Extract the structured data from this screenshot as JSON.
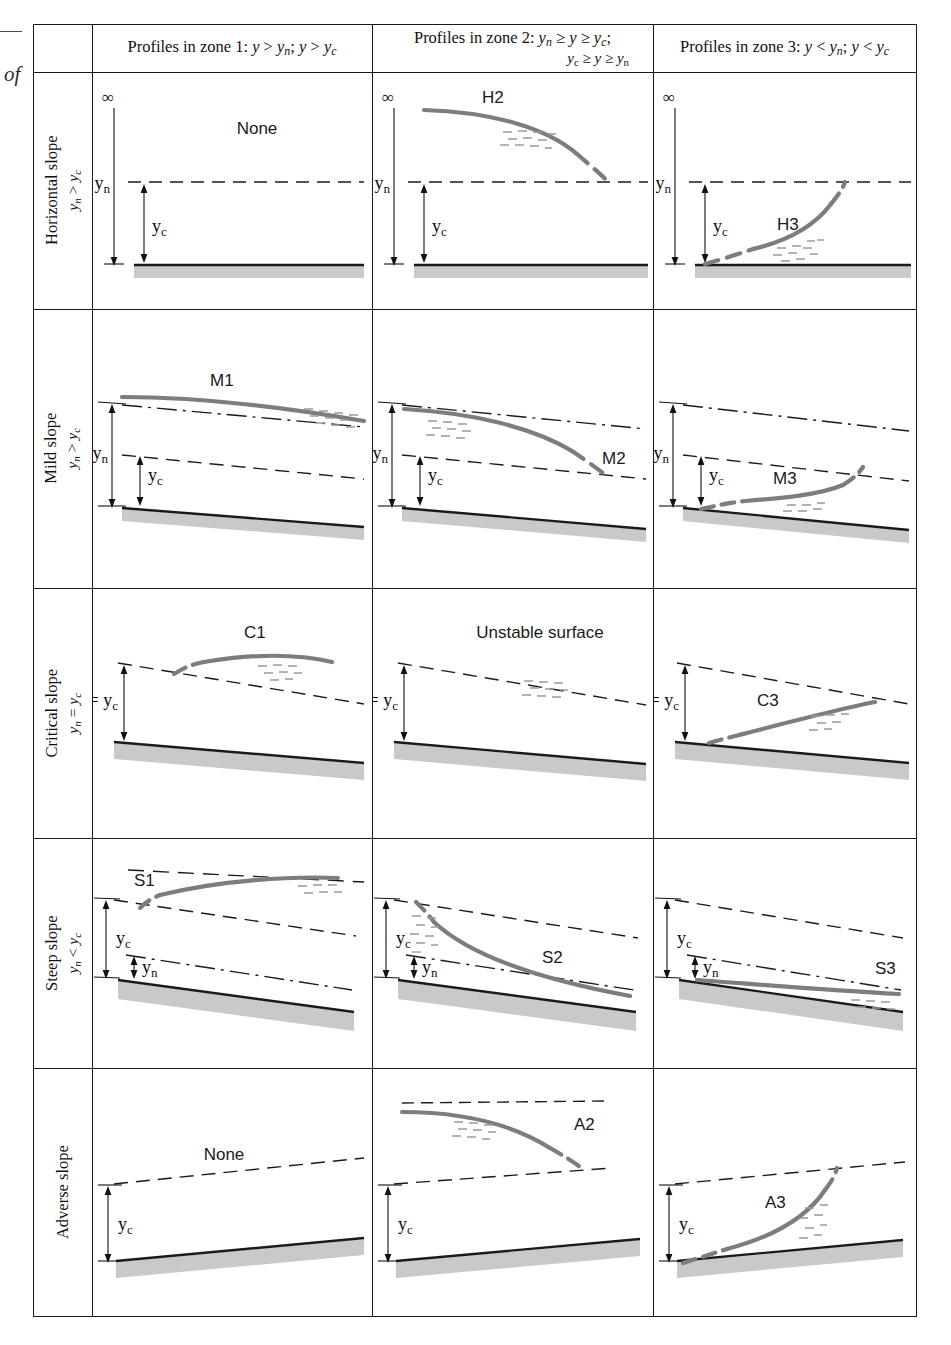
{
  "margin": {
    "partial_caption": "of"
  },
  "header": {
    "corner": "",
    "zone1": "Profiles in zone 1: y > yₙ; y > yᴄ",
    "zone1_parts": {
      "prefix": "Profiles in zone 1:",
      "c1": "y",
      "c1s": "n",
      "c2": "y",
      "c2s": "c"
    },
    "zone2_line1": "Profiles in zone 2: yₙ ≥ y ≥ yᴄ;",
    "zone2_line2": "yᴄ ≥ y ≥ yₙ",
    "zone3": "Profiles in zone 3: y < yₙ; y < yᴄ"
  },
  "rows": [
    {
      "name": "Horizontal slope",
      "condition": "yₙ > yᴄ",
      "sub_n": "n",
      "sub_c": "c",
      "rel": ">"
    },
    {
      "name": "Mild slope",
      "condition": "yₙ > yᴄ",
      "sub_n": "n",
      "sub_c": "c",
      "rel": ">"
    },
    {
      "name": "Critical slope",
      "condition": "yₙ = yᴄ",
      "sub_n": "n",
      "sub_c": "c",
      "rel": "="
    },
    {
      "name": "Steep slope",
      "condition": "yₙ < yᴄ",
      "sub_n": "n",
      "sub_c": "c",
      "rel": "<"
    },
    {
      "name": "Adverse slope",
      "condition": "",
      "sub_n": "n",
      "sub_c": "c",
      "rel": ""
    }
  ],
  "cells": {
    "h1": {
      "profile": "None",
      "kind": "none",
      "depth_labels": [
        "∞",
        "yₙ",
        "yᴄ"
      ]
    },
    "h2": {
      "profile": "H2",
      "kind": "curve",
      "depth_labels": [
        "∞",
        "yₙ",
        "yᴄ"
      ]
    },
    "h3": {
      "profile": "H3",
      "kind": "curve",
      "depth_labels": [
        "∞",
        "yₙ",
        "yᴄ"
      ]
    },
    "m1": {
      "profile": "M1",
      "kind": "curve",
      "depth_labels": [
        "yₙ",
        "yᴄ"
      ]
    },
    "m2": {
      "profile": "M2",
      "kind": "curve",
      "depth_labels": [
        "yₙ",
        "yᴄ"
      ]
    },
    "m3": {
      "profile": "M3",
      "kind": "curve",
      "depth_labels": [
        "yₙ",
        "yᴄ"
      ]
    },
    "c1": {
      "profile": "C1",
      "kind": "curve",
      "depth_labels": [
        "yₙ = yᴄ"
      ]
    },
    "c2": {
      "profile": "Unstable surface",
      "kind": "text",
      "depth_labels": [
        "yₙ = yᴄ"
      ]
    },
    "c3": {
      "profile": "C3",
      "kind": "curve",
      "depth_labels": [
        "yₙ = yᴄ"
      ]
    },
    "s1": {
      "profile": "S1",
      "kind": "curve",
      "depth_labels": [
        "yᴄ",
        "yₙ"
      ]
    },
    "s2": {
      "profile": "S2",
      "kind": "curve",
      "depth_labels": [
        "yᴄ",
        "yₙ"
      ]
    },
    "s3": {
      "profile": "S3",
      "kind": "curve",
      "depth_labels": [
        "yᴄ",
        "yₙ"
      ]
    },
    "a1": {
      "profile": "None",
      "kind": "none",
      "depth_labels": [
        "yᴄ"
      ]
    },
    "a2": {
      "profile": "A2",
      "kind": "curve",
      "depth_labels": [
        "yᴄ"
      ]
    },
    "a3": {
      "profile": "A3",
      "kind": "curve",
      "depth_labels": [
        "yᴄ"
      ]
    }
  },
  "colors": {
    "profile_curve": "#7d7d7d",
    "bed_line": "#1a1a1a",
    "bed_fill": "#c9c9c9",
    "reference_line": "#1a1a1a",
    "frame": "#1a1a1a",
    "text": "#111111"
  },
  "legend_semantics": {
    "solid_gray_curve": "actual water surface profile",
    "dashed_line": "critical depth line y_c",
    "dash_dot_line": "normal depth line y_n",
    "hatched_gray_band": "channel bed"
  }
}
